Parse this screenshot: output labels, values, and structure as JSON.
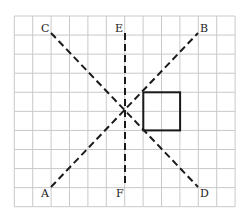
{
  "grid": {
    "x0": 14.3,
    "y0": 16,
    "cols": 12,
    "rows": 10,
    "cell_w": 18.4,
    "cell_h": 19.07,
    "line_color": "#c9c9c9"
  },
  "lines": [
    {
      "name": "line-AB",
      "from": "A",
      "to": "B",
      "x1": 51,
      "y1": 187,
      "x2": 198,
      "y2": 33
    },
    {
      "name": "line-CD",
      "from": "C",
      "to": "D",
      "x1": 51,
      "y1": 33,
      "x2": 198,
      "y2": 187
    },
    {
      "name": "line-EF",
      "from": "E",
      "to": "F",
      "x1": 125,
      "y1": 33,
      "x2": 125,
      "y2": 187
    }
  ],
  "square": {
    "x": 143.3,
    "y": 92.3,
    "w": 36.8,
    "h": 38.1
  },
  "labels": [
    {
      "text": "C",
      "x": 41,
      "y": 32
    },
    {
      "text": "E",
      "x": 115,
      "y": 32
    },
    {
      "text": "B",
      "x": 200,
      "y": 32
    },
    {
      "text": "A",
      "x": 41,
      "y": 197
    },
    {
      "text": "F",
      "x": 116,
      "y": 197
    },
    {
      "text": "D",
      "x": 200,
      "y": 197
    }
  ],
  "intersection": {
    "x": 125,
    "y": 111.3
  }
}
